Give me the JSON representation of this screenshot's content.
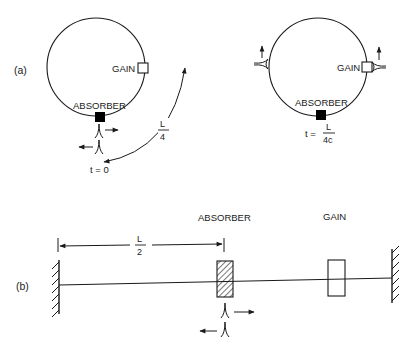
{
  "panel_a": {
    "label": "(a)",
    "left_ring": {
      "gain_label": "GAIN",
      "absorber_label": "ABSORBER",
      "time_label": "t = 0",
      "arc_label_num": "L",
      "arc_label_den": "4",
      "pulses": [
        {
          "direction": "right"
        },
        {
          "direction": "left"
        }
      ]
    },
    "right_ring": {
      "gain_label": "GAIN",
      "absorber_label": "ABSORBER",
      "time_prefix": "t =",
      "time_num": "L",
      "time_den": "4c",
      "pulses": [
        {
          "position": "left-side",
          "direction": "up"
        },
        {
          "position": "right-side-at-gain",
          "direction": "up"
        }
      ]
    }
  },
  "panel_b": {
    "label": "(b)",
    "absorber_label": "ABSORBER",
    "gain_label": "GAIN",
    "dimension_num": "L",
    "dimension_den": "2",
    "pulses": [
      {
        "direction": "right"
      },
      {
        "direction": "left"
      }
    ]
  },
  "colors": {
    "stroke": "#1a1a1a",
    "background": "#ffffff",
    "absorber_fill_ring": "#000000",
    "gain_fill": "#ffffff"
  }
}
